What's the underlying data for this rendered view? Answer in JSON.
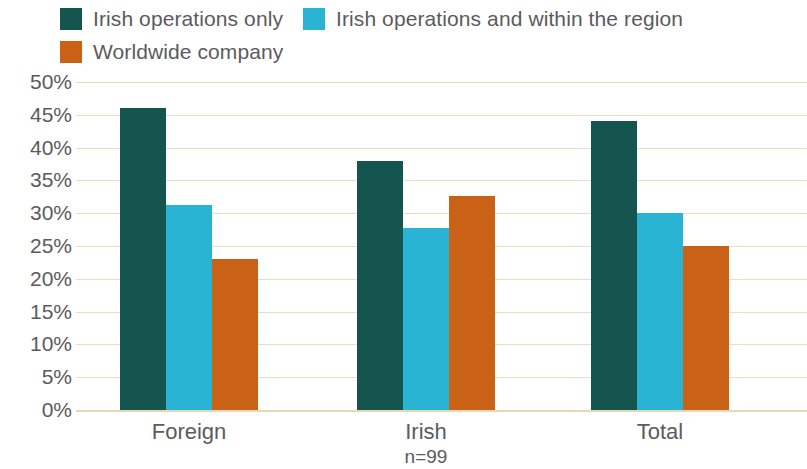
{
  "chart_data": {
    "type": "bar",
    "title": "",
    "subtitle": "",
    "xlabel": "",
    "ylabel": "",
    "categories": [
      "Foreign",
      "Irish",
      "Total"
    ],
    "category_notes": [
      "",
      "n=99",
      ""
    ],
    "series": [
      {
        "name": "Irish operations only",
        "color": "#14564f",
        "values": [
          46.0,
          38.0,
          44.0
        ]
      },
      {
        "name": "Irish operations and within the region",
        "color": "#29b4d4",
        "values": [
          31.3,
          27.7,
          30.0
        ]
      },
      {
        "name": "Worldwide company",
        "color": "#c96216",
        "values": [
          23.0,
          32.7,
          25.0
        ]
      }
    ],
    "ylim": [
      0,
      50
    ],
    "ytick_step": 5,
    "ytick_labels": [
      "50%",
      "45%",
      "40%",
      "35%",
      "30%",
      "25%",
      "20%",
      "15%",
      "10%",
      "5%",
      "0%"
    ],
    "ytick_values": [
      50,
      45,
      40,
      35,
      30,
      25,
      20,
      15,
      10,
      5,
      0
    ],
    "grid": true,
    "grid_color": "#e8dfc0",
    "legend_position": "top-left",
    "value_suffix": "%"
  }
}
